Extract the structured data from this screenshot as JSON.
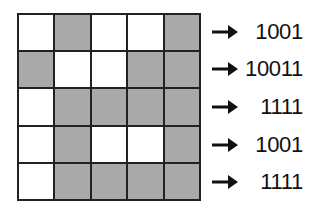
{
  "diagram": {
    "grid": {
      "rows": 5,
      "cols": 5,
      "cells": [
        [
          0,
          1,
          0,
          0,
          1
        ],
        [
          1,
          0,
          0,
          1,
          1
        ],
        [
          0,
          1,
          1,
          1,
          1
        ],
        [
          0,
          1,
          0,
          0,
          1
        ],
        [
          0,
          1,
          1,
          1,
          1
        ]
      ],
      "filled_color": "#a9a9a9",
      "empty_color": "#ffffff",
      "line_color": "#222222"
    },
    "arrow_icon": "right-arrow-icon",
    "row_codes": [
      "1001",
      "10011",
      "1111",
      "1001",
      "1111"
    ]
  }
}
